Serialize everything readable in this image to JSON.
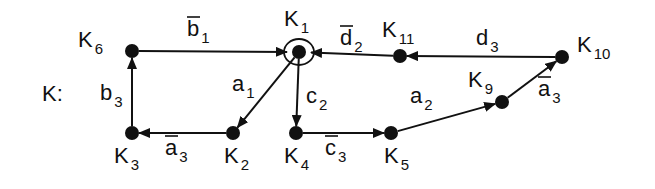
{
  "diagram": {
    "title": "K:",
    "colors": {
      "ink": "#111111",
      "background": "#ffffff"
    },
    "nodes": [
      {
        "id": "K1",
        "base": "K",
        "sub": "1",
        "x": 299,
        "y": 52,
        "lx": 284,
        "ly": 26,
        "self_loop": true
      },
      {
        "id": "K2",
        "base": "K",
        "sub": "2",
        "x": 233,
        "y": 133,
        "lx": 224,
        "ly": 163
      },
      {
        "id": "K3",
        "base": "K",
        "sub": "3",
        "x": 132,
        "y": 133,
        "lx": 114,
        "ly": 163
      },
      {
        "id": "K4",
        "base": "K",
        "sub": "4",
        "x": 296,
        "y": 133,
        "lx": 284,
        "ly": 163
      },
      {
        "id": "K5",
        "base": "K",
        "sub": "5",
        "x": 391,
        "y": 133,
        "lx": 384,
        "ly": 163
      },
      {
        "id": "K6",
        "base": "K",
        "sub": "6",
        "x": 132,
        "y": 51,
        "lx": 78,
        "ly": 47
      },
      {
        "id": "K9",
        "base": "K",
        "sub": "9",
        "x": 502,
        "y": 102,
        "lx": 468,
        "ly": 87
      },
      {
        "id": "K10",
        "base": "K",
        "sub": "10",
        "x": 562,
        "y": 57,
        "lx": 577,
        "ly": 52
      },
      {
        "id": "K11",
        "base": "K",
        "sub": "11",
        "x": 400,
        "y": 56,
        "lx": 382,
        "ly": 37
      }
    ],
    "edges": [
      {
        "from": "K6",
        "to": "K1",
        "label": "b",
        "sub": "1",
        "overline": true,
        "lx": 187,
        "ly": 36
      },
      {
        "from": "K1",
        "to": "K2",
        "label": "a",
        "sub": "1",
        "overline": false,
        "lx": 232,
        "ly": 91
      },
      {
        "from": "K1",
        "to": "K4",
        "label": "c",
        "sub": "2",
        "overline": false,
        "lx": 306,
        "ly": 103
      },
      {
        "from": "K2",
        "to": "K3",
        "label": "a",
        "sub": "3",
        "overline": true,
        "lx": 165,
        "ly": 155
      },
      {
        "from": "K3",
        "to": "K6",
        "label": "b",
        "sub": "3",
        "overline": false,
        "lx": 100,
        "ly": 100
      },
      {
        "from": "K4",
        "to": "K5",
        "label": "c",
        "sub": "3",
        "overline": true,
        "lx": 325,
        "ly": 155
      },
      {
        "from": "K5",
        "to": "K9",
        "label": "a",
        "sub": "2",
        "overline": false,
        "lx": 410,
        "ly": 103
      },
      {
        "from": "K9",
        "to": "K10",
        "label": "a",
        "sub": "3",
        "overline": true,
        "lx": 538,
        "ly": 96
      },
      {
        "from": "K10",
        "to": "K11",
        "label": "d",
        "sub": "3",
        "overline": false,
        "lx": 476,
        "ly": 45
      },
      {
        "from": "K11",
        "to": "K1",
        "label": "d",
        "sub": "2",
        "overline": true,
        "lx": 340,
        "ly": 45
      }
    ]
  }
}
